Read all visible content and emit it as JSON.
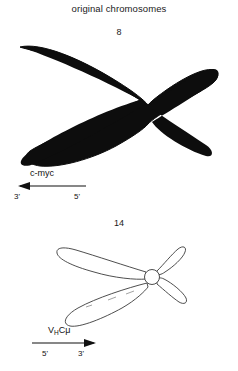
{
  "figure": {
    "title": "original chromosomes",
    "background_color": "#ffffff",
    "ink_color": "#000000"
  },
  "chromosomes": [
    {
      "number": "8",
      "style": "solid-filled",
      "fill_color": "#0d0d0d",
      "description": "chromosome 8 drawn as a solid black X with long left arms and short right arms",
      "gene": {
        "name": "c-myc",
        "name_plain": "c-myc",
        "arrow_direction": "left",
        "left_end_label": "3'",
        "right_end_label": "5'"
      }
    },
    {
      "number": "14",
      "style": "outline",
      "stroke_color": "#3a3a3a",
      "description": "chromosome 14 drawn as open outlined loops with a small circular centromere, long left arms and short right arms",
      "gene": {
        "name": "VHCµ",
        "name_prefix": "V",
        "name_subscript": "H",
        "name_suffix": "C",
        "name_greek": "μ",
        "arrow_direction": "right",
        "left_end_label": "5'",
        "right_end_label": "3'"
      }
    }
  ]
}
